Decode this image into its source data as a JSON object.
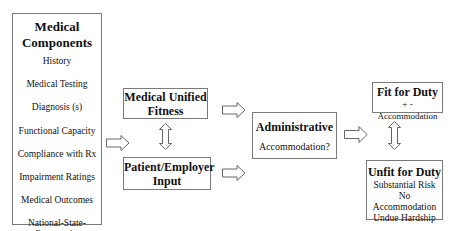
{
  "diagram": {
    "components_box": {
      "title": "Medical Components",
      "items": [
        "History",
        "Medical Testing",
        "Diagnosis (s)",
        "Functional Capacity",
        "Compliance with Rx",
        "Impairment Ratings",
        "Medical Outcomes",
        "National-State-Community Consensus"
      ]
    },
    "unified_box": {
      "title": "Medical Unified Fitness"
    },
    "patient_box": {
      "title": "Patient/Employer Input"
    },
    "admin_box": {
      "title": "Administrative",
      "subtitle": "Accommodation?"
    },
    "fit_box": {
      "title": "Fit for Duty",
      "subtitle": "+ - Accommodation"
    },
    "unfit_box": {
      "title": "Unfit for Duty",
      "lines": [
        "Substantial Risk",
        "No Accommodation",
        "Undue Hardship"
      ]
    },
    "connectors": [
      {
        "from": "Medical Components",
        "to": "Medical Unified Fitness / Patient/Employer Input",
        "type": "right-arrow"
      },
      {
        "from": "Medical Unified Fitness",
        "to": "Patient/Employer Input",
        "type": "double-vertical-arrow"
      },
      {
        "from": "Medical Unified Fitness",
        "to": "Administrative",
        "type": "right-arrow"
      },
      {
        "from": "Patient/Employer Input",
        "to": "Administrative",
        "type": "right-arrow"
      },
      {
        "from": "Administrative",
        "to": "Fit for Duty / Unfit for Duty",
        "type": "right-arrow"
      },
      {
        "from": "Fit for Duty",
        "to": "Unfit for Duty",
        "type": "double-vertical-arrow"
      }
    ],
    "colors": {
      "border": "#7a7a7a",
      "arrow_stroke": "#555555",
      "background": "#ffffff"
    }
  }
}
